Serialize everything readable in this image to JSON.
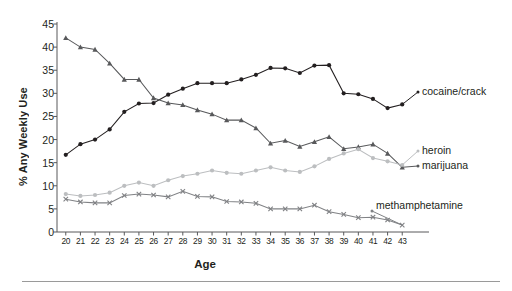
{
  "chart_data": {
    "type": "line",
    "title": "",
    "xlabel": "Age",
    "ylabel": "% Any Weekly Use",
    "x": [
      20,
      21,
      22,
      23,
      24,
      25,
      26,
      27,
      28,
      29,
      30,
      31,
      32,
      33,
      34,
      35,
      36,
      37,
      38,
      39,
      40,
      41,
      42,
      43
    ],
    "xlim": [
      19.4,
      43.6
    ],
    "ylim": [
      0,
      45
    ],
    "yticks": [
      0,
      5,
      10,
      15,
      20,
      25,
      30,
      35,
      40,
      45
    ],
    "grid": false,
    "legend_position": "right-inline",
    "series": [
      {
        "name": "cocaine/crack",
        "color": "#231f20",
        "marker": "circle",
        "values": [
          16.7,
          19.0,
          20.0,
          22.2,
          26.0,
          27.8,
          27.9,
          29.7,
          31.0,
          32.2,
          32.2,
          32.2,
          33.0,
          34.0,
          35.5,
          35.4,
          34.4,
          36.0,
          36.1,
          30.0,
          29.8,
          28.8,
          26.8,
          27.6
        ]
      },
      {
        "name": "marijuana",
        "color": "#58595b",
        "marker": "triangle",
        "values": [
          42.0,
          40.0,
          39.5,
          36.5,
          33.0,
          33.0,
          29.0,
          27.9,
          27.5,
          26.4,
          25.5,
          24.2,
          24.2,
          22.5,
          19.2,
          19.8,
          18.5,
          19.5,
          20.6,
          18.0,
          18.4,
          19.0,
          17.0,
          14.0
        ]
      },
      {
        "name": "heroin",
        "color": "#bcbec0",
        "marker": "circle",
        "values": [
          8.2,
          7.8,
          8.0,
          8.5,
          10.0,
          10.7,
          10.0,
          11.2,
          12.1,
          12.6,
          13.3,
          12.8,
          12.6,
          13.3,
          14.0,
          13.3,
          13.0,
          14.2,
          15.8,
          17.0,
          17.9,
          16.0,
          15.3,
          14.5
        ]
      },
      {
        "name": "methamphetamine",
        "color": "#808285",
        "marker": "cross",
        "values": [
          7.1,
          6.5,
          6.3,
          6.3,
          7.9,
          8.2,
          8.0,
          7.6,
          8.8,
          7.7,
          7.6,
          6.6,
          6.5,
          6.2,
          5.0,
          5.0,
          5.0,
          5.8,
          4.4,
          3.8,
          3.1,
          3.2,
          2.6,
          1.5
        ]
      }
    ]
  },
  "labels": {
    "cocaine": "cocaine/crack",
    "heroin": "heroin",
    "marijuana": "marijuana",
    "meth": "methamphetamine"
  },
  "axis": {
    "y_title": "% Any Weekly Use",
    "x_title": "Age"
  }
}
